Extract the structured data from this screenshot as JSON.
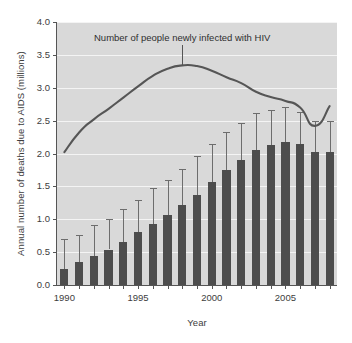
{
  "chart_data": {
    "type": "bar",
    "title": "",
    "subtitle": "",
    "xlabel": "Year",
    "ylabel": "Annual number of deaths due to AIDS (millions)",
    "xlim": [
      1989.5,
      2008.5
    ],
    "ylim": [
      0.0,
      4.0
    ],
    "grid": true,
    "legend_position": "none",
    "x_tick_labels": [
      "1990",
      "1995",
      "2000",
      "2005"
    ],
    "x_tick_values": [
      1990,
      1995,
      2000,
      2005
    ],
    "y_tick_labels": [
      "0.0",
      "0.5",
      "1.0",
      "1.5",
      "2.0",
      "2.5",
      "3.0",
      "3.5",
      "4.0"
    ],
    "y_tick_values": [
      0.0,
      0.5,
      1.0,
      1.5,
      2.0,
      2.5,
      3.0,
      3.5,
      4.0
    ],
    "categories": [
      1990,
      1991,
      1992,
      1993,
      1994,
      1995,
      1996,
      1997,
      1998,
      1999,
      2000,
      2001,
      2002,
      2003,
      2004,
      2005,
      2006,
      2007,
      2008
    ],
    "series": [
      {
        "name": "Annual number of deaths due to AIDS (millions)",
        "type": "bar",
        "color": "#4d4d4d",
        "values": [
          0.25,
          0.35,
          0.44,
          0.54,
          0.66,
          0.81,
          0.93,
          1.06,
          1.21,
          1.37,
          1.57,
          1.75,
          1.9,
          2.05,
          2.13,
          2.18,
          2.14,
          2.02,
          2.02
        ],
        "error_high": [
          0.7,
          0.76,
          0.92,
          1.0,
          1.15,
          1.3,
          1.48,
          1.6,
          1.76,
          1.96,
          2.14,
          2.32,
          2.46,
          2.62,
          2.66,
          2.7,
          2.63,
          2.5,
          2.5
        ]
      },
      {
        "name": "Number of people newly infected with HIV",
        "type": "line",
        "color": "#565656",
        "values": [
          2.02,
          2.32,
          2.52,
          2.68,
          2.85,
          3.02,
          3.18,
          3.29,
          3.34,
          3.33,
          3.26,
          3.16,
          3.07,
          2.94,
          2.86,
          2.8,
          2.7,
          2.42,
          2.72
        ]
      }
    ],
    "annotations": [
      {
        "text": "Number of people newly infected with HIV",
        "points_to_year": 1998,
        "points_to_value": 3.34
      }
    ]
  },
  "colors": {
    "plot_background": "#d9d9d9",
    "gridline": "#f4f4f4",
    "bar": "#4d4d4d",
    "error_bar": "#6d6d6d",
    "line": "#565656",
    "axis": "#555555",
    "text": "#3d3d3d",
    "page_background": "#ffffff"
  }
}
